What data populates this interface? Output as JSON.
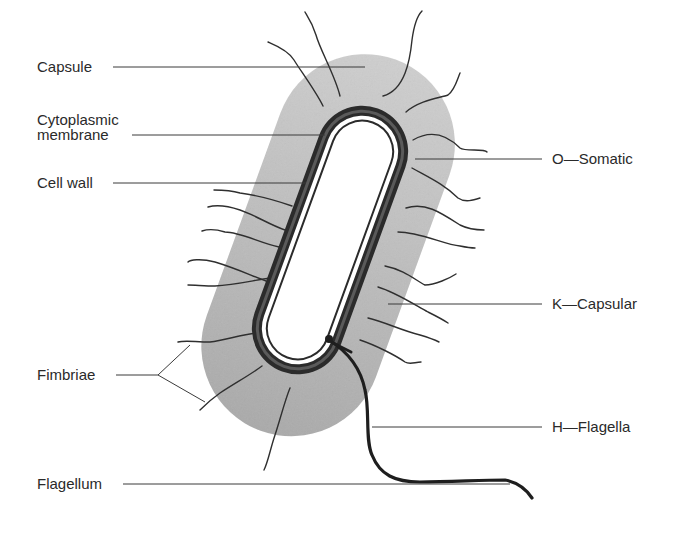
{
  "diagram": {
    "colors": {
      "background": "#ffffff",
      "capsule_fill": "#bdbdbd",
      "cell_wall": "#2b2b2b",
      "line": "#3a3a3a",
      "text": "#2a2a2a"
    },
    "labels": {
      "left": [
        {
          "id": "capsule",
          "text": "Capsule"
        },
        {
          "id": "cytoplasmic-membrane",
          "line1": "Cytoplasmic",
          "line2": "membrane"
        },
        {
          "id": "cell-wall",
          "text": "Cell wall"
        },
        {
          "id": "fimbriae",
          "text": "Fimbriae"
        },
        {
          "id": "flagellum",
          "text": "Flagellum"
        }
      ],
      "right": [
        {
          "id": "o-somatic",
          "text": "O—Somatic"
        },
        {
          "id": "k-capsular",
          "text": "K—Capsular"
        },
        {
          "id": "h-flagella",
          "text": "H—Flagella"
        }
      ]
    }
  }
}
